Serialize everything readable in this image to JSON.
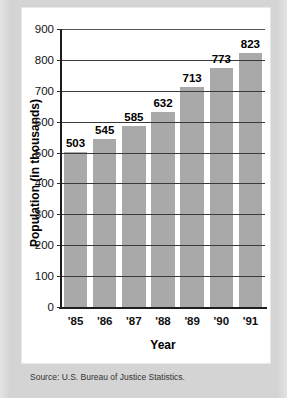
{
  "chart_data": {
    "type": "bar",
    "title": "",
    "xlabel": "Year",
    "ylabel": "Population (in thousands)",
    "categories": [
      "'85",
      "'86",
      "'87",
      "'88",
      "'89",
      "'90",
      "'91"
    ],
    "values": [
      503,
      545,
      585,
      632,
      713,
      773,
      823
    ],
    "data_labels": [
      "503",
      "545",
      "585",
      "632",
      "713",
      "773",
      "823"
    ],
    "ylim": [
      0,
      900
    ],
    "ytick_values": [
      0,
      100,
      200,
      300,
      400,
      500,
      600,
      700,
      800,
      900
    ],
    "ytick_labels": [
      "0",
      "100",
      "200",
      "300",
      "400",
      "500",
      "600",
      "700",
      "800",
      "900"
    ],
    "grid": "horizontal",
    "legend": "none",
    "bar_color": "#a9a9a9",
    "axis_color": "#1d1d1d",
    "gridline_color": "#3a3a3a",
    "panel_color": "#ffffff",
    "frame_color": "#d6d6d6"
  },
  "source_note": "Source: U.S. Bureau of Justice Statistics."
}
